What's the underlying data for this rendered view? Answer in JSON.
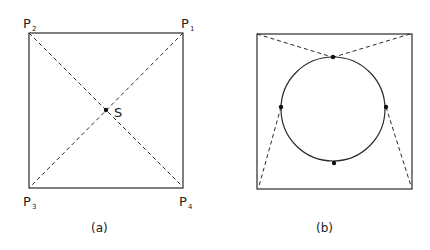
{
  "figure_a": {
    "corner_labels": {
      "p1": {
        "base": "P",
        "sub": "1"
      },
      "p2": {
        "base": "P",
        "sub": "2"
      },
      "p3": {
        "base": "P",
        "sub": "3"
      },
      "p4": {
        "base": "P",
        "sub": "4"
      }
    },
    "center_label": "S",
    "caption": "(a)"
  },
  "figure_b": {
    "caption": "(b)",
    "tangent_points": [
      "top",
      "left",
      "right",
      "bottom"
    ]
  }
}
